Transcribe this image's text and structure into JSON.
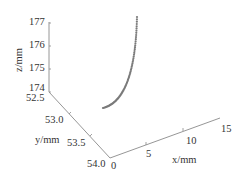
{
  "chart_data": {
    "type": "scatter",
    "projection": "3d",
    "title": "",
    "xlabel": "x/mm",
    "ylabel": "y/mm",
    "zlabel": "z/mm",
    "xlim": [
      0,
      15
    ],
    "ylim": [
      52.5,
      54.0
    ],
    "zlim": [
      174,
      177
    ],
    "x_ticks": [
      "0",
      "5",
      "10",
      "15"
    ],
    "y_ticks": [
      "52.5",
      "53.0",
      "53.5",
      "54.0"
    ],
    "z_ticks": [
      "174",
      "175",
      "176",
      "177"
    ],
    "grid": false,
    "legend": null,
    "marker_color": "#7a7a7a",
    "series": [
      {
        "name": "trajectory",
        "description": "curved dotted path rising steeply from near z=174.3 to z=177",
        "screen_path_start": [
          103,
          108
        ],
        "screen_path_end": [
          137,
          17
        ]
      }
    ]
  },
  "axes": {
    "color": "#8a8a8a"
  }
}
